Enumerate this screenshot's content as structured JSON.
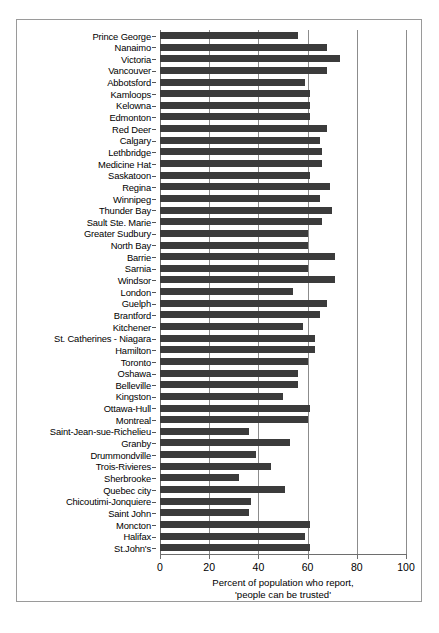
{
  "chart_data": {
    "type": "bar",
    "orientation": "horizontal",
    "title": "",
    "xlabel_lines": [
      "Percent of population who report,",
      "'people can be trusted'"
    ],
    "ylabel": "",
    "xlim": [
      0,
      100
    ],
    "xticks": [
      0,
      20,
      40,
      60,
      80,
      100
    ],
    "gridlines": [
      0,
      20,
      40,
      60,
      80,
      100
    ],
    "grid": true,
    "legend": "none",
    "bar_color": "#3b3b3b",
    "categories": [
      "Prince George",
      "Nanaimo",
      "Victoria",
      "Vancouver",
      "Abbotsford",
      "Kamloops",
      "Kelowna",
      "Edmonton",
      "Red Deer",
      "Calgary",
      "Lethbridge",
      "Medicine Hat",
      "Saskatoon",
      "Regina",
      "Winnipeg",
      "Thunder Bay",
      "Sault Ste. Marie",
      "Greater Sudbury",
      "North Bay",
      "Barrie",
      "Sarnia",
      "Windsor",
      "London",
      "Guelph",
      "Brantford",
      "Kitchener",
      "St. Catherines - Niagara",
      "Hamilton",
      "Toronto",
      "Oshawa",
      "Belleville",
      "Kingston",
      "Ottawa-Hull",
      "Montreal",
      "Saint-Jean-sue-Richelieu",
      "Granby",
      "Drummondville",
      "Trois-Rivieres",
      "Sherbrooke",
      "Quebec city",
      "Chicoutimi-Jonquiere",
      "Saint John",
      "Moncton",
      "Halifax",
      "St.John's"
    ],
    "values": [
      56,
      68,
      73,
      68,
      59,
      61,
      61,
      61,
      68,
      65,
      66,
      66,
      61,
      69,
      65,
      70,
      66,
      60,
      60,
      71,
      60,
      71,
      54,
      68,
      65,
      58,
      63,
      63,
      60,
      56,
      56,
      50,
      61,
      60,
      36,
      53,
      39,
      45,
      32,
      51,
      37,
      36,
      61,
      59,
      61
    ]
  }
}
